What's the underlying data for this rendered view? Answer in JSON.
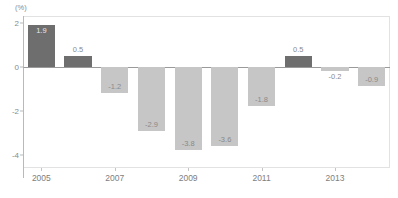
{
  "chart_data": {
    "type": "bar",
    "title": "",
    "subtitle": "",
    "unit_label": "(%)",
    "xlabel": "",
    "ylabel": "",
    "ylim": [
      -4.6,
      2.3
    ],
    "yticks": [
      2,
      0,
      -2,
      -4
    ],
    "ytick_labels": [
      "2",
      "0",
      "-2",
      "-4"
    ],
    "grid": false,
    "legend": false,
    "categories": [
      "2005",
      "2006",
      "2007",
      "2008",
      "2009",
      "2010",
      "2011",
      "2012",
      "2013",
      "2014"
    ],
    "xtick_labels": [
      "2005",
      "2007",
      "2009",
      "2011",
      "2013"
    ],
    "xtick_categories": [
      "2005",
      "2007",
      "2009",
      "2011",
      "2013"
    ],
    "values": [
      1.9,
      0.5,
      -1.2,
      -2.9,
      -3.8,
      -3.6,
      -1.8,
      0.5,
      -0.2,
      -0.9
    ],
    "data_labels": [
      "1.9",
      "0.5",
      "-1.2",
      "-2.9",
      "-3.8",
      "-3.6",
      "-1.8",
      "0.5",
      "-0.2",
      "-0.9"
    ],
    "colors": {
      "positive_bar": "#6e6e6e",
      "negative_bar": "#c6c6c6",
      "axis_line": "#9a9a9a",
      "frame": "#e2e2e2",
      "text": "#8a8a8a",
      "label_on_dark": "#e9e9e9"
    }
  }
}
